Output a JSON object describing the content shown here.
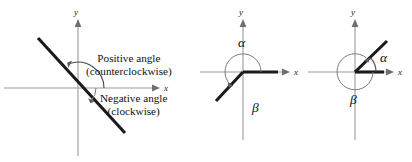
{
  "figure": {
    "axis_labels": {
      "x": "x",
      "y": "y"
    }
  },
  "panels": [
    {
      "id": "panel-1",
      "name": "positive-and-negative-angle-panel",
      "axis_x_label": "x",
      "axis_y_label": "y",
      "callouts": [
        {
          "name": "positive-angle-label",
          "line1": "Positive angle",
          "line2": "(counterclockwise)"
        },
        {
          "name": "negative-angle-label",
          "line1": "Negative angle",
          "line2": "(clockwise)"
        }
      ]
    },
    {
      "id": "panel-2",
      "name": "third-quadrant-coterminal-panel",
      "axis_x_label": "x",
      "axis_y_label": "y",
      "alpha_label": "α",
      "beta_label": "β"
    },
    {
      "id": "panel-3",
      "name": "first-quadrant-coterminal-panel",
      "axis_x_label": "x",
      "axis_y_label": "y",
      "alpha_label": "α",
      "beta_label": "β"
    }
  ],
  "colors": {
    "axis": "#9a9a9a",
    "ray": "#1b1b1b",
    "arc": "#7c7c7c",
    "text": "#111111",
    "background": "#ffffff"
  }
}
